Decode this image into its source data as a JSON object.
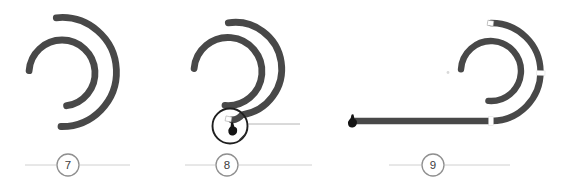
{
  "diagram": {
    "steps": [
      {
        "number": "7"
      },
      {
        "number": "8"
      },
      {
        "number": "9"
      }
    ],
    "icons": {
      "hand": "hand-press-icon",
      "magnifier": "detail-zoom-circle",
      "end_cap": "tube-end-cap",
      "joint": "tube-joint-marker"
    },
    "colors": {
      "tube": "#484848",
      "detail_ring": "#1f1f1f",
      "badge_ring": "#8f8f8f",
      "badge_text": "#3d3d3d",
      "badge_line": "#d0d0d0",
      "callout_line": "#b4b4b4",
      "hand": "#141414",
      "joint_fill": "#ffffff",
      "joint_edge": "#9a9a9a",
      "background": "#ffffff"
    }
  }
}
